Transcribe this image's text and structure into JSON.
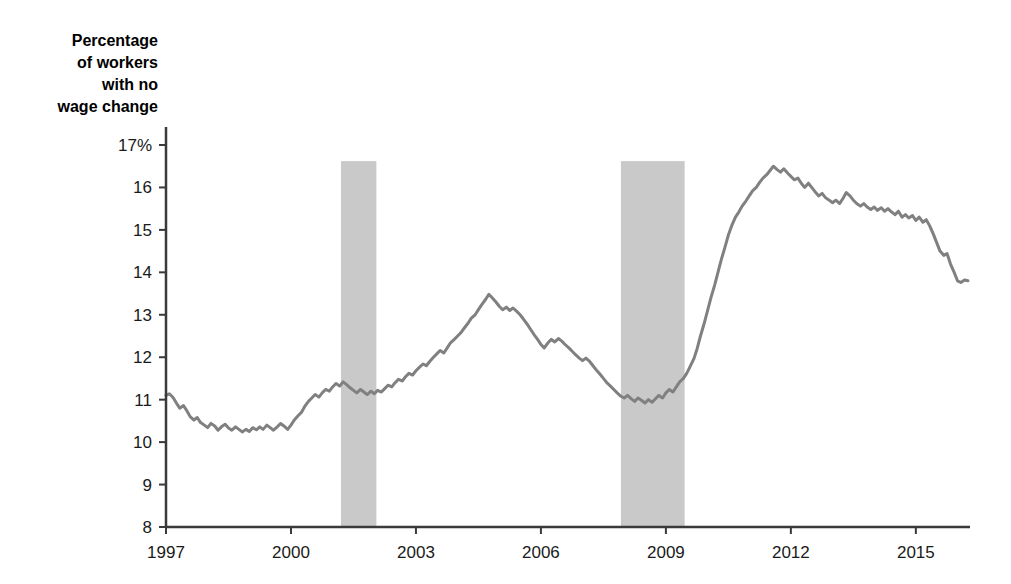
{
  "chart_data": {
    "type": "line",
    "title": "Percentage\nof workers\nwith no\nwage change",
    "title_lines": [
      "Percentage",
      "of workers",
      "with no",
      "wage change"
    ],
    "xlabel": "",
    "ylabel": "Percentage of workers with no wage change",
    "xlim": [
      1997.0,
      2016.3
    ],
    "ylim": [
      8,
      17
    ],
    "grid": false,
    "legend": null,
    "y_ticks": [
      8,
      9,
      10,
      11,
      12,
      13,
      14,
      15,
      16,
      17
    ],
    "y_tick_labels": [
      "8",
      "9",
      "10",
      "11",
      "12",
      "13",
      "14",
      "15",
      "16",
      "17%"
    ],
    "x_ticks": [
      1997,
      2000,
      2003,
      2006,
      2009,
      2012,
      2015
    ],
    "x_tick_labels": [
      "1997",
      "2000",
      "2003",
      "2006",
      "2009",
      "2012",
      "2015"
    ],
    "line_color": "#808080",
    "line_width": 3,
    "shaded_band_color": "#c9c9c9",
    "shaded_bands": [
      {
        "name": "recession-2001",
        "x0": 2001.2,
        "x1": 2002.05,
        "y0": 8,
        "y1": 16.62
      },
      {
        "name": "recession-2008",
        "x0": 2007.92,
        "x1": 2009.45,
        "y0": 8,
        "y1": 16.62
      }
    ],
    "series": [
      {
        "name": "Percentage of workers with no wage change",
        "x": [
          1997.0,
          1997.08,
          1997.17,
          1997.25,
          1997.33,
          1997.42,
          1997.5,
          1997.58,
          1997.67,
          1997.75,
          1997.83,
          1997.92,
          1998.0,
          1998.08,
          1998.17,
          1998.25,
          1998.33,
          1998.42,
          1998.5,
          1998.58,
          1998.67,
          1998.75,
          1998.83,
          1998.92,
          1999.0,
          1999.08,
          1999.17,
          1999.25,
          1999.33,
          1999.42,
          1999.5,
          1999.58,
          1999.67,
          1999.75,
          1999.83,
          1999.92,
          2000.0,
          2000.08,
          2000.17,
          2000.25,
          2000.33,
          2000.42,
          2000.5,
          2000.58,
          2000.67,
          2000.75,
          2000.83,
          2000.92,
          2001.0,
          2001.08,
          2001.17,
          2001.25,
          2001.33,
          2001.42,
          2001.5,
          2001.58,
          2001.67,
          2001.75,
          2001.83,
          2001.92,
          2002.0,
          2002.08,
          2002.17,
          2002.25,
          2002.33,
          2002.42,
          2002.5,
          2002.58,
          2002.67,
          2002.75,
          2002.83,
          2002.92,
          2003.0,
          2003.08,
          2003.17,
          2003.25,
          2003.33,
          2003.42,
          2003.5,
          2003.58,
          2003.67,
          2003.75,
          2003.83,
          2003.92,
          2004.0,
          2004.08,
          2004.17,
          2004.25,
          2004.33,
          2004.42,
          2004.5,
          2004.58,
          2004.67,
          2004.75,
          2004.83,
          2004.92,
          2005.0,
          2005.08,
          2005.17,
          2005.25,
          2005.33,
          2005.42,
          2005.5,
          2005.58,
          2005.67,
          2005.75,
          2005.83,
          2005.92,
          2006.0,
          2006.08,
          2006.17,
          2006.25,
          2006.33,
          2006.42,
          2006.5,
          2006.58,
          2006.67,
          2006.75,
          2006.83,
          2006.92,
          2007.0,
          2007.08,
          2007.17,
          2007.25,
          2007.33,
          2007.42,
          2007.5,
          2007.58,
          2007.67,
          2007.75,
          2007.83,
          2007.92,
          2008.0,
          2008.08,
          2008.17,
          2008.25,
          2008.33,
          2008.42,
          2008.5,
          2008.58,
          2008.67,
          2008.75,
          2008.83,
          2008.92,
          2009.0,
          2009.08,
          2009.17,
          2009.25,
          2009.33,
          2009.42,
          2009.5,
          2009.58,
          2009.67,
          2009.75,
          2009.83,
          2009.92,
          2010.0,
          2010.08,
          2010.17,
          2010.25,
          2010.33,
          2010.42,
          2010.5,
          2010.58,
          2010.67,
          2010.75,
          2010.83,
          2010.92,
          2011.0,
          2011.08,
          2011.17,
          2011.25,
          2011.33,
          2011.42,
          2011.5,
          2011.58,
          2011.67,
          2011.75,
          2011.83,
          2011.92,
          2012.0,
          2012.08,
          2012.17,
          2012.25,
          2012.33,
          2012.42,
          2012.5,
          2012.58,
          2012.67,
          2012.75,
          2012.83,
          2012.92,
          2013.0,
          2013.08,
          2013.17,
          2013.25,
          2013.33,
          2013.42,
          2013.5,
          2013.58,
          2013.67,
          2013.75,
          2013.83,
          2013.92,
          2014.0,
          2014.08,
          2014.17,
          2014.25,
          2014.33,
          2014.42,
          2014.5,
          2014.58,
          2014.67,
          2014.75,
          2014.83,
          2014.92,
          2015.0,
          2015.08,
          2015.17,
          2015.25,
          2015.33,
          2015.42,
          2015.5,
          2015.58,
          2015.67,
          2015.75,
          2015.83,
          2015.92,
          2016.0,
          2016.08,
          2016.17,
          2016.25
        ],
        "y": [
          11.1,
          11.14,
          11.05,
          10.92,
          10.8,
          10.86,
          10.74,
          10.6,
          10.52,
          10.58,
          10.46,
          10.4,
          10.34,
          10.44,
          10.38,
          10.28,
          10.36,
          10.42,
          10.33,
          10.28,
          10.36,
          10.3,
          10.24,
          10.3,
          10.25,
          10.34,
          10.29,
          10.36,
          10.3,
          10.4,
          10.34,
          10.28,
          10.36,
          10.44,
          10.38,
          10.3,
          10.4,
          10.52,
          10.62,
          10.7,
          10.84,
          10.96,
          11.04,
          11.12,
          11.06,
          11.16,
          11.24,
          11.2,
          11.3,
          11.38,
          11.32,
          11.42,
          11.36,
          11.28,
          11.22,
          11.16,
          11.24,
          11.18,
          11.12,
          11.2,
          11.14,
          11.22,
          11.18,
          11.26,
          11.34,
          11.3,
          11.4,
          11.48,
          11.44,
          11.54,
          11.62,
          11.58,
          11.68,
          11.76,
          11.84,
          11.8,
          11.9,
          12.0,
          12.08,
          12.16,
          12.1,
          12.22,
          12.34,
          12.42,
          12.5,
          12.58,
          12.7,
          12.8,
          12.92,
          13.0,
          13.12,
          13.24,
          13.36,
          13.48,
          13.4,
          13.3,
          13.2,
          13.12,
          13.18,
          13.1,
          13.16,
          13.08,
          13.0,
          12.9,
          12.78,
          12.66,
          12.54,
          12.42,
          12.3,
          12.22,
          12.34,
          12.42,
          12.36,
          12.44,
          12.38,
          12.3,
          12.22,
          12.14,
          12.06,
          11.98,
          11.92,
          11.98,
          11.9,
          11.8,
          11.7,
          11.6,
          11.5,
          11.4,
          11.32,
          11.24,
          11.16,
          11.08,
          11.04,
          11.1,
          11.02,
          10.96,
          11.04,
          10.98,
          10.92,
          11.0,
          10.94,
          11.02,
          11.1,
          11.04,
          11.16,
          11.24,
          11.18,
          11.3,
          11.42,
          11.5,
          11.62,
          11.78,
          11.96,
          12.2,
          12.5,
          12.8,
          13.1,
          13.4,
          13.7,
          14.0,
          14.3,
          14.6,
          14.88,
          15.1,
          15.3,
          15.42,
          15.56,
          15.68,
          15.8,
          15.92,
          16.0,
          16.12,
          16.22,
          16.3,
          16.4,
          16.5,
          16.42,
          16.36,
          16.44,
          16.34,
          16.26,
          16.18,
          16.22,
          16.1,
          16.0,
          16.1,
          16.0,
          15.9,
          15.8,
          15.86,
          15.76,
          15.7,
          15.64,
          15.7,
          15.62,
          15.74,
          15.88,
          15.8,
          15.7,
          15.62,
          15.56,
          15.62,
          15.54,
          15.48,
          15.54,
          15.46,
          15.52,
          15.44,
          15.5,
          15.42,
          15.36,
          15.44,
          15.3,
          15.36,
          15.28,
          15.34,
          15.22,
          15.3,
          15.18,
          15.24,
          15.1,
          14.9,
          14.7,
          14.5,
          14.4,
          14.44,
          14.2,
          14.0,
          13.8,
          13.76,
          13.82,
          13.8
        ]
      }
    ]
  },
  "figure": {
    "background": "#ffffff",
    "axis_color": "#3a3a3a"
  }
}
